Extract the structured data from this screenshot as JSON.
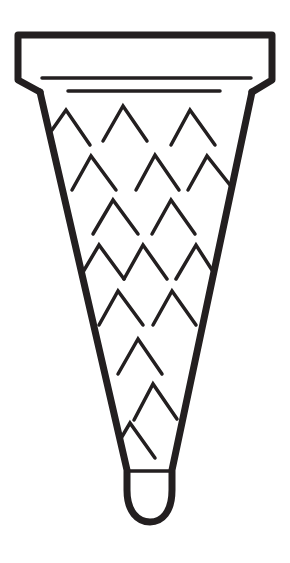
{
  "title": "Ice cream cone line drawing",
  "colors": {
    "background": "#ffffff",
    "ink": "#231f20"
  },
  "cone": {
    "rim": {
      "label": "cone rim"
    },
    "body": {
      "label": "cone body"
    },
    "waffle_pattern": {
      "label": "waffle chevron pattern",
      "chevrons": [
        {
          "x1": 52,
          "y1": 130,
          "x2": 66,
          "y2": 110,
          "x3": 90,
          "y3": 145
        },
        {
          "x1": 103,
          "y1": 141,
          "x2": 123,
          "y2": 106,
          "x3": 147,
          "y3": 141
        },
        {
          "x1": 171,
          "y1": 145,
          "x2": 190,
          "y2": 110,
          "x3": 215,
          "y3": 145
        },
        {
          "x1": 72,
          "y1": 190,
          "x2": 91,
          "y2": 156,
          "x3": 116,
          "y3": 190
        },
        {
          "x1": 136,
          "y1": 190,
          "x2": 155,
          "y2": 155,
          "x3": 179,
          "y3": 190
        },
        {
          "x1": 188,
          "y1": 190,
          "x2": 207,
          "y2": 156,
          "x3": 230,
          "y3": 185
        },
        {
          "x1": 93,
          "y1": 234,
          "x2": 113,
          "y2": 200,
          "x3": 138,
          "y3": 234
        },
        {
          "x1": 152,
          "y1": 234,
          "x2": 171,
          "y2": 200,
          "x3": 195,
          "y3": 234
        },
        {
          "x1": 83,
          "y1": 272,
          "x2": 99,
          "y2": 245,
          "x3": 124,
          "y3": 279
        },
        {
          "x1": 124,
          "y1": 279,
          "x2": 143,
          "y2": 245,
          "x3": 167,
          "y3": 279
        },
        {
          "x1": 176,
          "y1": 279,
          "x2": 196,
          "y2": 245,
          "x3": 212,
          "y3": 270
        },
        {
          "x1": 99,
          "y1": 325,
          "x2": 118,
          "y2": 291,
          "x3": 143,
          "y3": 325
        },
        {
          "x1": 153,
          "y1": 325,
          "x2": 172,
          "y2": 291,
          "x3": 196,
          "y3": 325
        },
        {
          "x1": 118,
          "y1": 374,
          "x2": 138,
          "y2": 339,
          "x3": 162,
          "y3": 374
        },
        {
          "x1": 134,
          "y1": 420,
          "x2": 153,
          "y2": 384,
          "x3": 177,
          "y3": 419
        },
        {
          "x1": 120,
          "y1": 440,
          "x2": 130,
          "y2": 423,
          "x3": 155,
          "y3": 458
        }
      ]
    },
    "tip": {
      "label": "cone tip"
    }
  }
}
